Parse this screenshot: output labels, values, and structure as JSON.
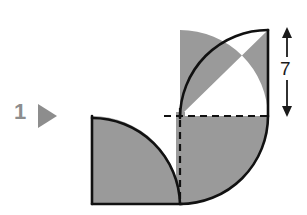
{
  "figure": {
    "background_color": "#ffffff",
    "problem_marker": {
      "number": "1",
      "bullet_icon": "right-triangle-icon",
      "color": "#8d8d8d"
    },
    "shape": {
      "name": "two-quarter-circle-leaf",
      "fill_color": "#9a9a9a",
      "stroke_color": "#111111",
      "stroke_width": 2.5,
      "description": "Two quarter circles joined at a common corner forming an S/leaf shape",
      "radius_value": 7,
      "center_point": {
        "x": 180,
        "y": 116
      },
      "upper_quarter": {
        "corner": {
          "x": 268,
          "y": 30
        },
        "arc_start": {
          "x": 180,
          "y": 30
        },
        "arc_end": {
          "x": 268,
          "y": 116
        }
      },
      "lower_quarter": {
        "corner": {
          "x": 92,
          "y": 203
        },
        "arc_start": {
          "x": 92,
          "y": 116
        },
        "arc_end": {
          "x": 180,
          "y": 203
        },
        "bulge_end": {
          "x": 268,
          "y": 116
        }
      }
    },
    "dashed_lines": {
      "color": "#111111",
      "dash_pattern": "7,5",
      "horizontal": {
        "x1": 164,
        "y1": 116,
        "x2": 272,
        "y2": 116
      },
      "vertical": {
        "x1": 180,
        "y1": 108,
        "x2": 180,
        "y2": 205
      }
    },
    "dimension": {
      "label": "7",
      "orientation": "vertical",
      "axis_x": 287,
      "top_y": 28,
      "bottom_y": 117,
      "arrow_color": "#1a1a1a"
    }
  }
}
